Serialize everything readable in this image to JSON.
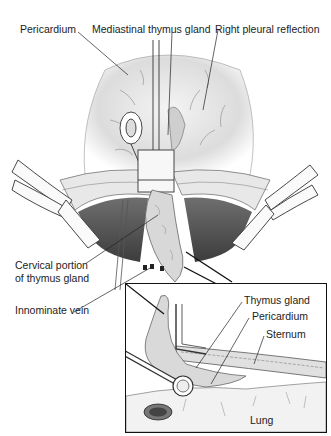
{
  "figure": {
    "labels": {
      "pericardium_top": "Pericardium",
      "mediastinal_thymus": "Mediastinal thymus gland",
      "right_pleural": "Right pleural reflection",
      "cervical_line1": "Cervical portion",
      "cervical_line2": "of thymus gland",
      "innominate_vein": "Innominate vein"
    },
    "inset": {
      "labels": {
        "thymus_gland": "Thymus gland",
        "pericardium": "Pericardium",
        "sternum": "Sternum",
        "lung": "Lung"
      }
    }
  }
}
